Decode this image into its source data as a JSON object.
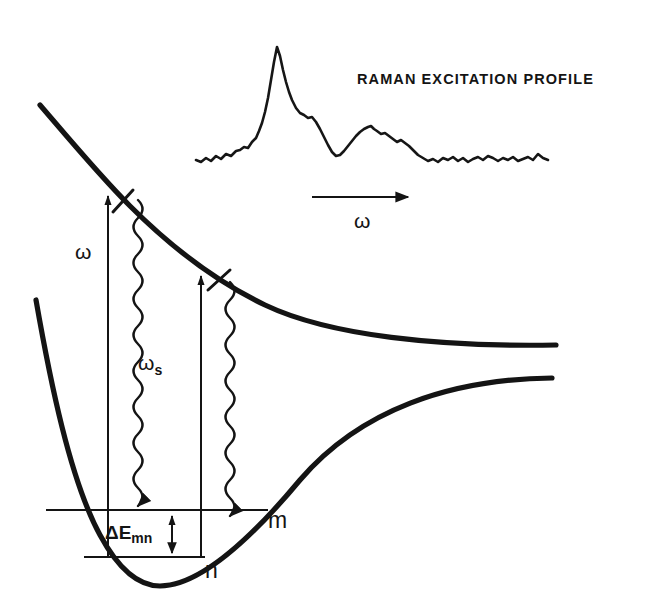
{
  "figure": {
    "title": "RAMAN   EXCITATION   PROFILE",
    "background_color": "#ffffff",
    "ink_color": "#141414"
  },
  "labels": {
    "title_raman": "RAMAN   EXCITATION   PROFILE",
    "omega_axis": "ω",
    "omega_incident": "ω",
    "omega_scattered": "ω",
    "omega_scattered_sub": "s",
    "delta_energy": "ΔE",
    "delta_energy_sub": "mn",
    "level_m": "m",
    "level_n": "n"
  },
  "chart_data": {
    "type": "line",
    "title": "RAMAN   EXCITATION   PROFILE",
    "xlabel": "ω",
    "ylabel": "",
    "grid": false,
    "legend": null,
    "series": [
      {
        "name": "Raman excitation profile",
        "x": [
          196,
          201,
          206,
          211,
          216,
          221,
          226,
          231,
          236,
          240,
          244,
          248,
          252,
          256,
          259,
          262,
          265,
          268,
          271,
          274,
          277,
          280,
          283,
          286,
          289,
          292,
          296,
          300,
          304,
          308,
          312,
          316,
          320,
          324,
          328,
          332,
          336,
          340,
          344,
          348,
          352,
          356,
          360,
          364,
          368,
          371,
          374,
          377,
          381,
          385,
          389,
          393,
          397,
          401,
          405,
          409,
          413,
          418,
          423,
          428,
          433,
          438,
          443,
          448,
          453,
          458,
          463,
          468,
          473,
          478,
          483,
          488,
          493,
          498,
          503,
          508,
          513,
          518,
          523,
          528,
          533,
          538,
          543,
          548
        ],
        "y": [
          160,
          162,
          158,
          161,
          156,
          159,
          154,
          156,
          151,
          150,
          147,
          148,
          142,
          138,
          131,
          123,
          112,
          98,
          80,
          62,
          47,
          56,
          70,
          82,
          92,
          100,
          108,
          113,
          115,
          118,
          117,
          122,
          129,
          137,
          145,
          152,
          156,
          155,
          151,
          146,
          141,
          136,
          132,
          129,
          127,
          126,
          129,
          131,
          134,
          133,
          136,
          139,
          142,
          140,
          143,
          146,
          150,
          155,
          158,
          161,
          159,
          162,
          158,
          160,
          157,
          161,
          158,
          162,
          159,
          157,
          160,
          156,
          158,
          161,
          158,
          160,
          157,
          161,
          159,
          157,
          160,
          154,
          158,
          160
        ]
      }
    ],
    "annotations": [
      {
        "type": "arrow",
        "label": "ω",
        "x_from": 312,
        "x_to": 413,
        "y": 197
      }
    ]
  },
  "potential_curves": {
    "excited_state": {
      "name": "excited-state-repulsive-curve",
      "description": "steeply descending repulsive potential asymptoting to the right"
    },
    "ground_state": {
      "name": "ground-state-morse-curve",
      "description": "Morse-like bound potential with minimum near left and dissociation plateau at right"
    }
  },
  "transitions": [
    {
      "name": "incident-photon-arrow-1",
      "label": "ω",
      "x": 108,
      "y_from": 557,
      "y_to": 188
    },
    {
      "name": "incident-photon-arrow-2",
      "label": "",
      "x": 201,
      "y_from": 557,
      "y_to": 268
    },
    {
      "name": "scattered-photon-wavy-1",
      "label": "ωs",
      "x": 145,
      "y_from": 200,
      "y_to": 510
    },
    {
      "name": "scattered-photon-wavy-2",
      "label": "",
      "x": 237,
      "y_from": 280,
      "y_to": 510
    }
  ],
  "energy_levels": [
    {
      "name": "level-m",
      "label": "m",
      "y": 510
    },
    {
      "name": "level-n",
      "label": "n",
      "y": 557
    }
  ]
}
